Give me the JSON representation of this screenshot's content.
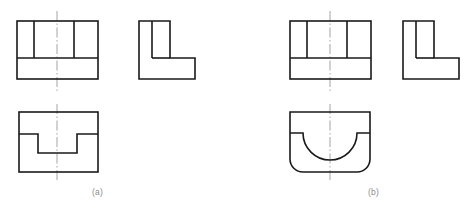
{
  "figure": {
    "kind": "orthographic-projection-drawing",
    "background_color": "#ffffff",
    "line_color": "#1a1a1a",
    "centerline_color": "#9a9a9a",
    "caption_color": "#8d8d8d",
    "line_width": 1.6,
    "centerline_width": 0.9,
    "width": 467,
    "height": 212
  },
  "captions": {
    "a": "(a)",
    "b": "(b)"
  },
  "groups": [
    {
      "id": "group-a",
      "label": "(a)",
      "views": [
        {
          "id": "a-front-view",
          "name": "front-view",
          "shape": "rectangle-with-ribs",
          "x": 17,
          "y": 21,
          "width": 81,
          "height": 58,
          "rib_divider_y": 58,
          "vertical_ribs_x": [
            34,
            74
          ],
          "centerline_x": 57,
          "centerline_top": 11,
          "centerline_bottom": 92
        },
        {
          "id": "a-side-view",
          "name": "side-view",
          "shape": "L-profile",
          "x": 139,
          "y": 21,
          "width": 56,
          "height": 58,
          "upright_right_x": 170,
          "foot_top_y": 58,
          "inner_vertical_x": 152
        },
        {
          "id": "a-top-view",
          "name": "top-view",
          "shape": "rectangle-with-rectangular-notch",
          "x": 19,
          "y": 112,
          "width": 79,
          "height": 60,
          "notch_left_x": 38,
          "notch_right_x": 77,
          "notch_shoulder_y": 134,
          "notch_bottom_y": 153,
          "centerline_x": 57,
          "centerline_top": 104,
          "centerline_bottom": 182
        }
      ]
    },
    {
      "id": "group-b",
      "label": "(b)",
      "views": [
        {
          "id": "b-front-view",
          "name": "front-view",
          "shape": "rectangle-with-ribs",
          "x": 290,
          "y": 21,
          "width": 81,
          "height": 58,
          "rib_divider_y": 58,
          "vertical_ribs_x": [
            307,
            347
          ],
          "centerline_x": 330,
          "centerline_top": 11,
          "centerline_bottom": 92
        },
        {
          "id": "b-side-view",
          "name": "side-view",
          "shape": "L-profile",
          "x": 403,
          "y": 21,
          "width": 56,
          "height": 58,
          "upright_right_x": 434,
          "foot_top_y": 58,
          "inner_vertical_x": 416
        },
        {
          "id": "b-top-view",
          "name": "top-view",
          "shape": "rounded-rectangle-with-semicircular-notch",
          "x": 290,
          "y": 112,
          "width": 80,
          "height": 60,
          "corner_radius": 13,
          "notch_left_x": 303,
          "notch_right_x": 357,
          "notch_shoulder_y": 133,
          "notch_radius": 27,
          "centerline_x": 330,
          "centerline_top": 104,
          "centerline_bottom": 182
        }
      ]
    }
  ]
}
